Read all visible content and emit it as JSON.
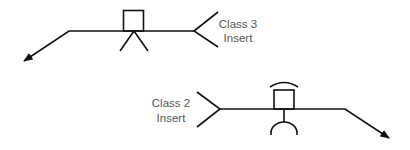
{
  "diagram": {
    "colors": {
      "stroke": "#111111",
      "label": "#555555",
      "background": "#ffffff"
    },
    "symbols": [
      {
        "id": "class3",
        "label_line1": "Class 3",
        "label_line2": "Insert",
        "marker": "square-with-tripod-legs",
        "arrow_direction": "down-left"
      },
      {
        "id": "class2",
        "label_line1": "Class 2",
        "label_line2": "Insert",
        "marker": "square-with-arc-above-and-stem-with-cup-below",
        "arrow_direction": "down-right"
      }
    ]
  }
}
